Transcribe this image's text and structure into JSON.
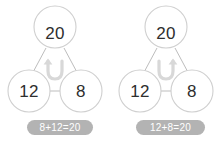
{
  "worksheet": {
    "title": "Number bond commutative property pair",
    "background_color": "#ffffff",
    "circle_stroke_color": "#cfcfcf",
    "connector_color": "#bdbdbd",
    "number_color": "#2e2e2e",
    "badge_color": "#b3b3b3",
    "badge_text_color": "#ffffff",
    "arrow_color": "#d6d6d6"
  },
  "diagrams": [
    {
      "id": "left",
      "whole_label": "20",
      "part_left_label": "12",
      "part_right_label": "8",
      "swap_arrow_icon": "swap-arrow-left-icon",
      "swap_arrow_direction": "counter-clockwise",
      "equation": "8+12=20"
    },
    {
      "id": "right",
      "whole_label": "20",
      "part_left_label": "12",
      "part_right_label": "8",
      "swap_arrow_icon": "swap-arrow-right-icon",
      "swap_arrow_direction": "clockwise",
      "equation": "12+8=20"
    }
  ]
}
